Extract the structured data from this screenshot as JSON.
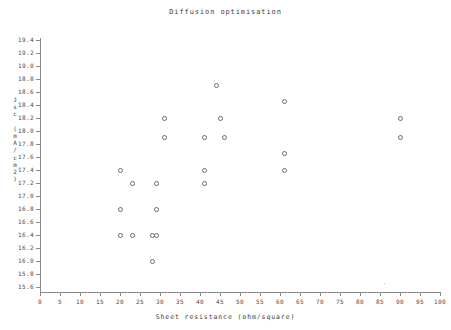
{
  "chart_data": {
    "type": "scatter",
    "title": "Diffusion optimisation",
    "xlabel": "Sheet resistance (ohm/square)",
    "ylabel": "Jsc (mA/cm2)",
    "ylabel_chars": [
      "J",
      "s",
      "c",
      " ",
      "(",
      "m",
      "A",
      "/",
      "c",
      "m",
      "2",
      ")"
    ],
    "xlim": [
      0,
      100
    ],
    "ylim": [
      15.6,
      19.4
    ],
    "xticks": [
      0,
      5,
      10,
      15,
      20,
      25,
      30,
      35,
      40,
      45,
      50,
      55,
      60,
      65,
      70,
      75,
      80,
      85,
      90,
      95,
      100
    ],
    "xtick_labels": [
      "0",
      "5",
      "10",
      "15",
      "20",
      "25",
      "30",
      "35",
      "40",
      "45",
      "50",
      "55",
      "60",
      "65",
      "70",
      "75",
      "80",
      "85",
      "90",
      "95",
      "100"
    ],
    "yticks": [
      15.6,
      15.8,
      16.0,
      16.2,
      16.4,
      16.6,
      16.8,
      17.0,
      17.2,
      17.4,
      17.6,
      17.8,
      18.0,
      18.2,
      18.4,
      18.6,
      18.8,
      19.0,
      19.2,
      19.4
    ],
    "ytick_labels": [
      "15.6",
      "15.8",
      "16.0",
      "16.2",
      "16.4",
      "16.6",
      "16.8",
      "17.0",
      "17.2",
      "17.4",
      "17.6",
      "17.8",
      "18.0",
      "18.2",
      "18.4",
      "18.6",
      "18.8",
      "19.0",
      "19.2",
      "19.4"
    ],
    "grid": false,
    "legend": false,
    "marker": "open-circle",
    "marker_color": "#6b6b6b",
    "axis_color": "#8a8a8a",
    "background": "#ffffff",
    "points": [
      {
        "x": 20,
        "y": 17.4
      },
      {
        "x": 20,
        "y": 16.8
      },
      {
        "x": 20,
        "y": 16.4
      },
      {
        "x": 23,
        "y": 17.2
      },
      {
        "x": 23,
        "y": 16.4
      },
      {
        "x": 28,
        "y": 16.4
      },
      {
        "x": 28,
        "y": 16.0
      },
      {
        "x": 29,
        "y": 17.2
      },
      {
        "x": 29,
        "y": 16.8
      },
      {
        "x": 29,
        "y": 16.4
      },
      {
        "x": 31,
        "y": 18.2
      },
      {
        "x": 31,
        "y": 17.9
      },
      {
        "x": 41,
        "y": 17.9
      },
      {
        "x": 41,
        "y": 17.4
      },
      {
        "x": 41,
        "y": 17.2
      },
      {
        "x": 44,
        "y": 18.7
      },
      {
        "x": 45,
        "y": 18.2
      },
      {
        "x": 46,
        "y": 17.9
      },
      {
        "x": 61,
        "y": 18.45
      },
      {
        "x": 61,
        "y": 17.65
      },
      {
        "x": 61,
        "y": 17.4
      },
      {
        "x": 90,
        "y": 18.2
      },
      {
        "x": 90,
        "y": 17.9
      }
    ],
    "point_count": 23
  }
}
